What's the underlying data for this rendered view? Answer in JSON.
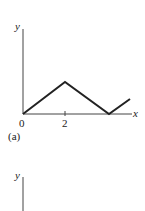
{
  "figure_a": {
    "y_label": "y",
    "x_label": "x",
    "origin_label": "0",
    "tick_label": "2",
    "panel_label": "(a)",
    "polyline": [
      [
        0,
        0
      ],
      [
        2,
        1
      ],
      [
        4,
        0
      ],
      [
        5,
        0.5
      ]
    ]
  },
  "figure_b": {
    "y_label": "y"
  },
  "colors": {
    "line": "#222222",
    "axis": "#444444"
  }
}
